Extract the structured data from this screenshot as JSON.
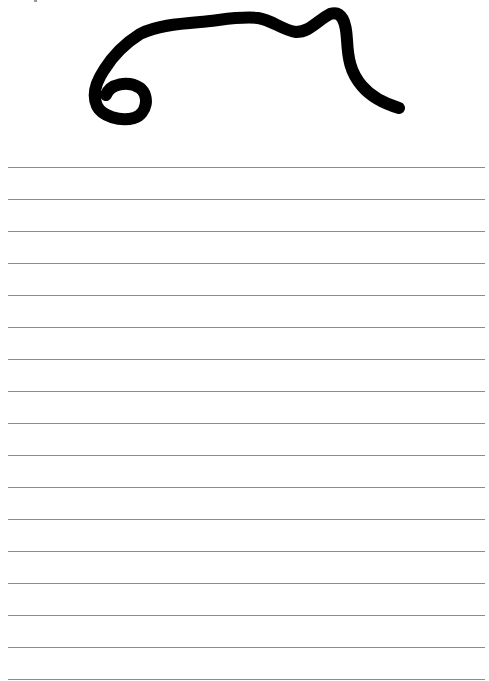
{
  "page": {
    "type": "lined-paper",
    "background_color": "#ffffff",
    "rule_color": "#8c8c8c",
    "ink_color": "#000000"
  },
  "drawing": {
    "description": "freehand black ink scribble: a small loop on the left leading into a long wavy stroke that rises, dips, and descends to the right",
    "stroke_width": 12,
    "path": "M106 95 C110 84 128 80 140 88 C150 96 147 114 134 118 C120 122 102 116 97 106 C92 95 96 82 104 70 C112 57 124 44 140 34 C156 26 176 24 200 22 C222 20 240 16 258 18 C272 20 282 30 296 32 C310 32 318 20 330 14 C342 10 346 22 347 40 C348 58 350 72 362 86 C372 98 386 104 399 108"
  },
  "rules": {
    "count": 17,
    "start_y": 167,
    "spacing": 32,
    "left": 8,
    "right": 485
  }
}
